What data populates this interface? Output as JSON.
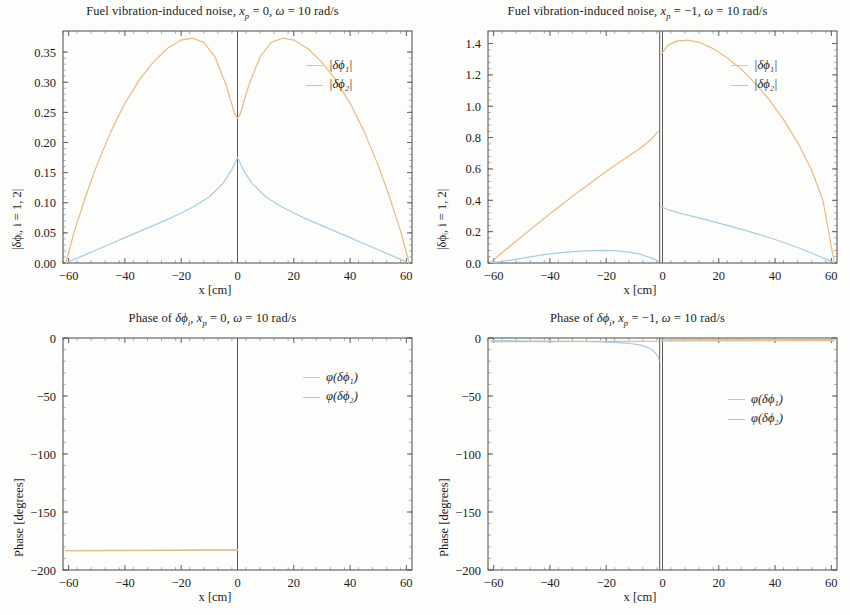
{
  "figure": {
    "width": 850,
    "height": 615,
    "background": "#fdfdfb",
    "colors": {
      "series1": "#a7cee3",
      "series2": "#e9bb88",
      "axis": "#4a4a4a"
    }
  },
  "panels": [
    {
      "id": "top-left",
      "title": "Fuel vibration-induced noise, x_p = 0, ω = 10 rad/s",
      "title_html": "Fuel vibration-induced noise, <i>x</i><sub><i>p</i></sub> = 0, <i>ω</i> = 10 rad/s",
      "xlabel": "x [cm]",
      "ylabel": "|δϕᵢ, i = 1, 2|",
      "legend": [
        "|δϕ₁|",
        "|δϕ₂|"
      ],
      "xticks": [
        "-60",
        "-40",
        "-20",
        "0",
        "20",
        "40",
        "60"
      ],
      "yticks": [
        "0.00",
        "0.05",
        "0.10",
        "0.15",
        "0.20",
        "0.25",
        "0.30",
        "0.35"
      ]
    },
    {
      "id": "top-right",
      "title": "Fuel vibration-induced noise, x_p = -1, ω = 10 rad/s",
      "title_html": "Fuel vibration-induced noise, <i>x</i><sub><i>p</i></sub> = −1, <i>ω</i> = 10 rad/s",
      "xlabel": "x [cm]",
      "ylabel": "|δϕᵢ, i = 1, 2|",
      "legend": [
        "|δϕ₁|",
        "|δϕ₂|"
      ],
      "xticks": [
        "-60",
        "-40",
        "-20",
        "0",
        "20",
        "40",
        "60"
      ],
      "yticks": [
        "0.0",
        "0.2",
        "0.4",
        "0.6",
        "0.8",
        "1.0",
        "1.2",
        "1.4"
      ]
    },
    {
      "id": "bottom-left",
      "title": "Phase of δϕ_i, x_p = 0, ω = 10 rad/s",
      "title_html": "Phase of <i>δϕ</i><sub><i>i</i></sub>, <i>x</i><sub><i>p</i></sub> = 0, <i>ω</i> = 10 rad/s",
      "xlabel": "x [cm]",
      "ylabel": "Phase [degrees]",
      "legend": [
        "φ(δϕ₁)",
        "φ(δϕ₂)"
      ],
      "xticks": [
        "-60",
        "-40",
        "-20",
        "0",
        "20",
        "40",
        "60"
      ],
      "yticks": [
        "-200",
        "-150",
        "-100",
        "-50",
        "0"
      ]
    },
    {
      "id": "bottom-right",
      "title": "Phase of δϕ_i, x_p = -1, ω = 10 rad/s",
      "title_html": "Phase of <i>δϕ</i><sub><i>i</i></sub>, <i>x</i><sub><i>p</i></sub> = −1, <i>ω</i> = 10 rad/s",
      "xlabel": "x [cm]",
      "ylabel": "Phase [degrees]",
      "legend": [
        "φ(δϕ₁)",
        "φ(δϕ₂)"
      ],
      "xticks": [
        "-60",
        "-40",
        "-20",
        "0",
        "20",
        "40",
        "60"
      ],
      "yticks": [
        "-200",
        "-150",
        "-100",
        "-50",
        "0"
      ]
    }
  ],
  "chart_data": [
    {
      "type": "line",
      "panel": "top-left",
      "title": "Fuel vibration-induced noise, x_p = 0, ω = 10 rad/s",
      "xlabel": "x [cm]",
      "ylabel": "|δϕ_i, i = 1, 2|",
      "xlim": [
        -62,
        62
      ],
      "ylim": [
        0.0,
        0.385
      ],
      "grid": false,
      "legend_position": "top-right-inside",
      "vertical_marker_x": 0,
      "series": [
        {
          "name": "|δϕ₁|",
          "color": "#a7cee3",
          "x": [
            -61,
            -58,
            -54,
            -50,
            -45,
            -40,
            -35,
            -30,
            -25,
            -20,
            -15,
            -10,
            -5,
            -2,
            0,
            2,
            5,
            10,
            15,
            20,
            25,
            30,
            35,
            40,
            45,
            50,
            54,
            58,
            61
          ],
          "y": [
            0.0,
            0.006,
            0.014,
            0.022,
            0.032,
            0.042,
            0.052,
            0.062,
            0.072,
            0.083,
            0.095,
            0.11,
            0.133,
            0.155,
            0.175,
            0.155,
            0.133,
            0.11,
            0.095,
            0.083,
            0.072,
            0.062,
            0.052,
            0.042,
            0.032,
            0.022,
            0.014,
            0.006,
            0.0
          ]
        },
        {
          "name": "|δϕ₂|",
          "color": "#e9bb88",
          "x": [
            -61,
            -58,
            -54,
            -50,
            -45,
            -40,
            -35,
            -30,
            -25,
            -20,
            -16,
            -12,
            -8,
            -4,
            -1,
            0,
            1,
            4,
            8,
            12,
            16,
            20,
            25,
            30,
            35,
            40,
            45,
            50,
            54,
            58,
            61
          ],
          "y": [
            0.0,
            0.052,
            0.11,
            0.162,
            0.218,
            0.265,
            0.303,
            0.333,
            0.356,
            0.37,
            0.373,
            0.366,
            0.342,
            0.295,
            0.247,
            0.24,
            0.247,
            0.295,
            0.342,
            0.366,
            0.373,
            0.37,
            0.356,
            0.333,
            0.303,
            0.265,
            0.218,
            0.162,
            0.11,
            0.052,
            0.0
          ]
        }
      ]
    },
    {
      "type": "line",
      "panel": "top-right",
      "title": "Fuel vibration-induced noise, x_p = -1, ω = 10 rad/s",
      "xlabel": "x [cm]",
      "ylabel": "|δϕ_i, i = 1, 2|",
      "xlim": [
        -62,
        62
      ],
      "ylim": [
        0.0,
        1.48
      ],
      "grid": false,
      "legend_position": "top-right-inside",
      "vertical_marker_x": -1,
      "series": [
        {
          "name": "|δϕ₁|",
          "color": "#a7cee3",
          "segments": [
            {
              "x": [
                -61,
                -57,
                -52,
                -47,
                -42,
                -37,
                -32,
                -27,
                -22,
                -17,
                -12,
                -8,
                -4,
                -1.5
              ],
              "y": [
                0.002,
                0.01,
                0.024,
                0.039,
                0.053,
                0.064,
                0.073,
                0.078,
                0.08,
                0.079,
                0.07,
                0.056,
                0.033,
                0.012
              ]
            },
            {
              "x": [
                -0.5,
                2,
                6,
                10,
                15,
                20,
                25,
                30,
                35,
                40,
                45,
                50,
                55,
                58,
                61
              ],
              "y": [
                0.36,
                0.34,
                0.318,
                0.3,
                0.278,
                0.255,
                0.23,
                0.205,
                0.178,
                0.15,
                0.118,
                0.086,
                0.048,
                0.025,
                0.002
              ]
            }
          ]
        },
        {
          "name": "|δϕ₂|",
          "color": "#e9bb88",
          "segments": [
            {
              "x": [
                -61,
                -57,
                -52,
                -47,
                -42,
                -37,
                -32,
                -27,
                -22,
                -17,
                -12,
                -8,
                -4,
                -1.5
              ],
              "y": [
                0.005,
                0.065,
                0.14,
                0.213,
                0.285,
                0.355,
                0.425,
                0.492,
                0.558,
                0.622,
                0.682,
                0.73,
                0.79,
                0.84
              ]
            },
            {
              "x": [
                -0.5,
                2,
                5,
                9,
                13,
                18,
                23,
                28,
                33,
                38,
                43,
                48,
                53,
                57,
                61
              ],
              "y": [
                1.33,
                1.39,
                1.415,
                1.422,
                1.408,
                1.368,
                1.31,
                1.235,
                1.145,
                1.04,
                0.915,
                0.77,
                0.59,
                0.4,
                0.005
              ]
            }
          ]
        }
      ]
    },
    {
      "type": "line",
      "panel": "bottom-left",
      "title": "Phase of δϕ_i, x_p = 0, ω = 10 rad/s",
      "xlabel": "x [cm]",
      "ylabel": "Phase [degrees]",
      "xlim": [
        -62,
        62
      ],
      "ylim": [
        -200,
        0
      ],
      "grid": false,
      "legend_position": "top-right-inside",
      "vertical_marker_x": 0,
      "series": [
        {
          "name": "φ(δϕ₁)",
          "color": "#a7cee3",
          "x": [
            -61,
            -40,
            -20,
            0
          ],
          "y": [
            -183.2,
            -183.0,
            -182.8,
            -182.6
          ]
        },
        {
          "name": "φ(δϕ₂)",
          "color": "#e9bb88",
          "x": [
            -61,
            -40,
            -20,
            0
          ],
          "y": [
            -183.4,
            -183.2,
            -183.0,
            -182.8
          ]
        }
      ]
    },
    {
      "type": "line",
      "panel": "bottom-right",
      "title": "Phase of δϕ_i, x_p = -1, ω = 10 rad/s",
      "xlabel": "x [cm]",
      "ylabel": "Phase [degrees]",
      "xlim": [
        -62,
        62
      ],
      "ylim": [
        -200,
        0
      ],
      "grid": false,
      "legend_position": "right-inside",
      "vertical_marker_x": -1,
      "series": [
        {
          "name": "φ(δϕ₁)",
          "color": "#a7cee3",
          "segments": [
            {
              "x": [
                -61,
                -50,
                -40,
                -30,
                -22,
                -16,
                -11,
                -7,
                -4.5,
                -3,
                -2,
                -1.5,
                -1.2
              ],
              "y": [
                -2.2,
                -2.4,
                -2.6,
                -2.9,
                -3.3,
                -3.9,
                -4.9,
                -6.6,
                -9.0,
                -11.5,
                -14.5,
                -17.0,
                -19.5
              ]
            },
            {
              "x": [
                -0.6,
                5,
                15,
                30,
                45,
                61
              ],
              "y": [
                -1.6,
                -1.5,
                -1.4,
                -1.3,
                -1.2,
                -1.1
              ]
            }
          ]
        },
        {
          "name": "φ(δϕ₂)",
          "color": "#e9bb88",
          "segments": [
            {
              "x": [
                -61,
                -40,
                -20,
                -8,
                -2,
                -1.2
              ],
              "y": [
                -3.2,
                -3.1,
                -3.0,
                -2.9,
                -2.8,
                -2.8
              ]
            },
            {
              "x": [
                -0.6,
                10,
                30,
                50,
                61
              ],
              "y": [
                -2.6,
                -2.5,
                -2.4,
                -2.3,
                -2.2
              ]
            }
          ]
        }
      ]
    }
  ]
}
